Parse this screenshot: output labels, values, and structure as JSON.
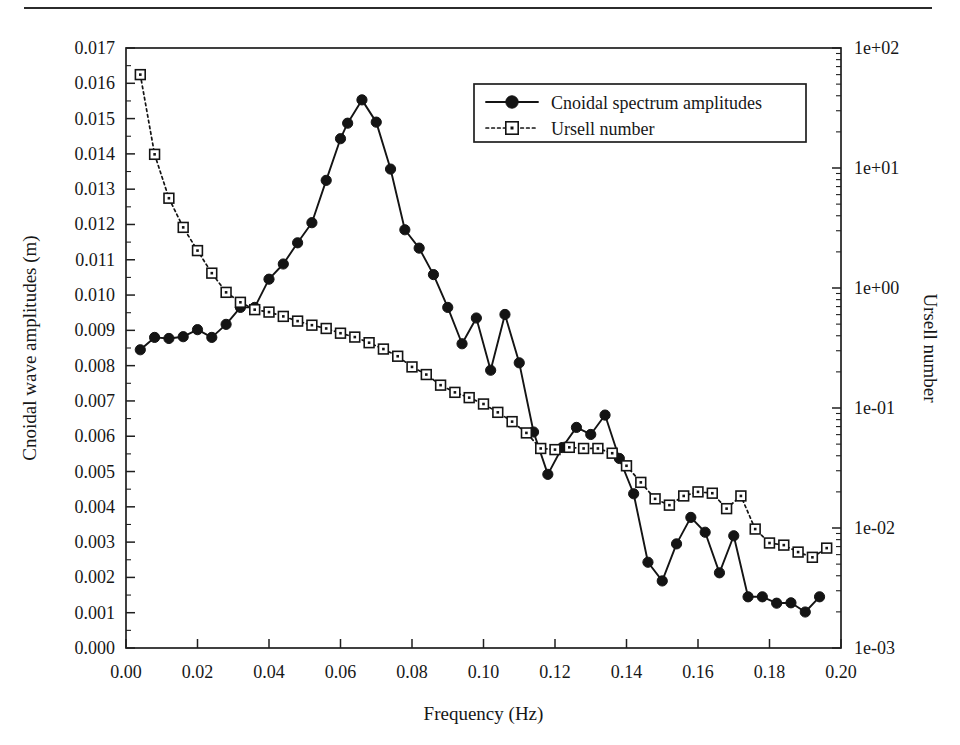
{
  "figure": {
    "page_rule": "horizontal-rule",
    "background": "#ffffff",
    "ink_color": "#141414"
  },
  "axes": {
    "left": {
      "title": "Cnoidal wave amplitudes (m)",
      "scale": "linear",
      "min": 0.0,
      "max": 0.017,
      "tick_step": 0.001,
      "ticks": [
        "0.000",
        "0.001",
        "0.002",
        "0.003",
        "0.004",
        "0.005",
        "0.006",
        "0.007",
        "0.008",
        "0.009",
        "0.010",
        "0.011",
        "0.012",
        "0.013",
        "0.014",
        "0.015",
        "0.016",
        "0.017"
      ]
    },
    "right": {
      "title": "Ursell number",
      "scale": "log",
      "min": 0.001,
      "max": 100,
      "ticks": [
        "1e-03",
        "1e-02",
        "1e-01",
        "1e+00",
        "1e+01",
        "1e+02"
      ]
    },
    "bottom": {
      "title": "Frequency (Hz)",
      "scale": "linear",
      "min": 0.0,
      "max": 0.2,
      "tick_step": 0.02,
      "ticks": [
        "0.00",
        "0.02",
        "0.04",
        "0.06",
        "0.08",
        "0.10",
        "0.12",
        "0.14",
        "0.16",
        "0.18",
        "0.20"
      ]
    }
  },
  "legend": {
    "position": "top-right-inside",
    "entries": [
      {
        "label": "Cnoidal spectrum amplitudes",
        "marker": "filled-circle",
        "line": "solid"
      },
      {
        "label": "Ursell number",
        "marker": "open-square",
        "line": "dotted"
      }
    ]
  },
  "chart_data": {
    "type": "line",
    "title": "",
    "xlabel": "Frequency (Hz)",
    "ylabel": "Cnoidal wave amplitudes (m)",
    "y2label": "Ursell number",
    "xlim": [
      0.0,
      0.2
    ],
    "ylim": [
      0.0,
      0.017
    ],
    "y2lim": [
      0.001,
      100
    ],
    "y2scale": "log",
    "grid": false,
    "legend_position": "upper right",
    "series": [
      {
        "name": "Cnoidal spectrum amplitudes",
        "axis": "left",
        "marker": "filled-circle",
        "linestyle": "solid",
        "x": [
          0.004,
          0.008,
          0.012,
          0.016,
          0.02,
          0.024,
          0.028,
          0.032,
          0.036,
          0.04,
          0.044,
          0.048,
          0.052,
          0.056,
          0.06,
          0.062,
          0.066,
          0.07,
          0.074,
          0.078,
          0.082,
          0.086,
          0.09,
          0.094,
          0.098,
          0.102,
          0.106,
          0.11,
          0.114,
          0.118,
          0.122,
          0.126,
          0.13,
          0.134,
          0.138,
          0.142,
          0.146,
          0.15,
          0.154,
          0.158,
          0.162,
          0.166,
          0.17,
          0.174,
          0.178,
          0.182,
          0.186,
          0.19,
          0.194
        ],
        "y": [
          0.00845,
          0.0088,
          0.00877,
          0.00882,
          0.00902,
          0.0088,
          0.00917,
          0.00965,
          0.00965,
          0.01045,
          0.01088,
          0.01148,
          0.01205,
          0.01325,
          0.01443,
          0.01487,
          0.01553,
          0.0149,
          0.01357,
          0.01185,
          0.01133,
          0.01058,
          0.00965,
          0.00862,
          0.00935,
          0.00787,
          0.00945,
          0.00808,
          0.00612,
          0.00492,
          0.00568,
          0.00625,
          0.00605,
          0.0066,
          0.00537,
          0.00437,
          0.00243,
          0.0019,
          0.00295,
          0.0037,
          0.00328,
          0.00213,
          0.00318,
          0.00145,
          0.00145,
          0.00127,
          0.00128,
          0.00102,
          0.00145
        ]
      },
      {
        "name": "Ursell number",
        "axis": "right",
        "marker": "open-square",
        "linestyle": "dotted",
        "x": [
          0.004,
          0.008,
          0.012,
          0.016,
          0.02,
          0.024,
          0.028,
          0.032,
          0.036,
          0.04,
          0.044,
          0.048,
          0.052,
          0.056,
          0.06,
          0.064,
          0.068,
          0.072,
          0.076,
          0.08,
          0.084,
          0.088,
          0.092,
          0.096,
          0.1,
          0.104,
          0.108,
          0.112,
          0.116,
          0.12,
          0.124,
          0.128,
          0.132,
          0.136,
          0.14,
          0.144,
          0.148,
          0.152,
          0.156,
          0.16,
          0.164,
          0.168,
          0.172,
          0.176,
          0.18,
          0.184,
          0.188,
          0.192,
          0.196
        ],
        "y": [
          60.0,
          13.0,
          5.6,
          3.2,
          2.05,
          1.33,
          0.92,
          0.76,
          0.66,
          0.63,
          0.58,
          0.53,
          0.49,
          0.46,
          0.42,
          0.39,
          0.35,
          0.31,
          0.27,
          0.22,
          0.19,
          0.155,
          0.135,
          0.122,
          0.108,
          0.092,
          0.077,
          0.062,
          0.046,
          0.045,
          0.047,
          0.046,
          0.046,
          0.042,
          0.033,
          0.024,
          0.0175,
          0.0155,
          0.0185,
          0.02,
          0.0195,
          0.0145,
          0.0185,
          0.0098,
          0.0075,
          0.0072,
          0.0063,
          0.0057,
          0.0068
        ]
      }
    ]
  }
}
